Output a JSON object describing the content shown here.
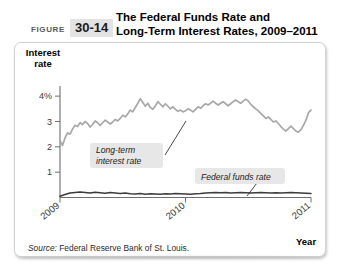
{
  "figure": {
    "label": "FIGURE",
    "number": "30-14",
    "title_line1": "The Federal Funds Rate and",
    "title_line2": "Long-Term Interest Rates, 2009–2011"
  },
  "axes": {
    "y_title_line1": "Interest",
    "y_title_line2": "rate",
    "x_title": "Year"
  },
  "annotations": {
    "long_term_line1": "Long-term",
    "long_term_line2": "interest rate",
    "fed_funds": "Federal funds rate"
  },
  "source": {
    "prefix": "Source:",
    "text": " Federal Reserve Bank of St. Louis."
  },
  "colors": {
    "long_term_line": "#a8a8a8",
    "fed_funds_line": "#3c3c3c",
    "axis": "#6e6e6e",
    "badge_bg": "#e3e3e3",
    "annotation_bg": "#e7e7e7",
    "card_border": "#d2d2d2"
  },
  "chart_data": {
    "type": "line",
    "title": "The Federal Funds Rate and Long-Term Interest Rates, 2009–2011",
    "xlabel": "Year",
    "ylabel": "Interest rate",
    "ylim": [
      0,
      4.4
    ],
    "xlim": [
      2009.0,
      2011.0
    ],
    "ytick_labels": [
      "4%",
      "3",
      "2",
      "1"
    ],
    "ytick_values": [
      4,
      3,
      2,
      1
    ],
    "xtick_labels": [
      "2009",
      "2010",
      "2011"
    ],
    "xtick_values": [
      2009,
      2010,
      2011
    ],
    "grid": false,
    "legend": "annotations-inline",
    "series": [
      {
        "name": "Long-term interest rate",
        "color": "#a8a8a8",
        "x": [
          2009.0,
          2009.02,
          2009.04,
          2009.06,
          2009.08,
          2009.1,
          2009.12,
          2009.14,
          2009.16,
          2009.18,
          2009.2,
          2009.22,
          2009.24,
          2009.26,
          2009.28,
          2009.3,
          2009.32,
          2009.34,
          2009.36,
          2009.38,
          2009.4,
          2009.42,
          2009.44,
          2009.46,
          2009.48,
          2009.5,
          2009.52,
          2009.54,
          2009.56,
          2009.58,
          2009.6,
          2009.62,
          2009.64,
          2009.66,
          2009.68,
          2009.7,
          2009.72,
          2009.74,
          2009.76,
          2009.78,
          2009.8,
          2009.82,
          2009.84,
          2009.86,
          2009.88,
          2009.9,
          2009.92,
          2009.94,
          2009.96,
          2009.98,
          2010.0,
          2010.02,
          2010.04,
          2010.06,
          2010.08,
          2010.1,
          2010.12,
          2010.14,
          2010.16,
          2010.18,
          2010.2,
          2010.22,
          2010.24,
          2010.26,
          2010.28,
          2010.3,
          2010.32,
          2010.34,
          2010.36,
          2010.38,
          2010.4,
          2010.42,
          2010.44,
          2010.46,
          2010.48,
          2010.5,
          2010.52,
          2010.54,
          2010.56,
          2010.58,
          2010.6,
          2010.62,
          2010.64,
          2010.66,
          2010.68,
          2010.7,
          2010.72,
          2010.74,
          2010.76,
          2010.78,
          2010.8,
          2010.82,
          2010.84,
          2010.86,
          2010.88,
          2010.9,
          2010.92,
          2010.94,
          2010.96,
          2010.98,
          2011.0
        ],
        "values": [
          2.25,
          2.05,
          2.35,
          2.55,
          2.5,
          2.7,
          2.85,
          2.8,
          2.95,
          2.88,
          3.0,
          2.92,
          2.78,
          2.88,
          3.02,
          2.95,
          2.85,
          2.95,
          3.05,
          2.98,
          2.9,
          2.98,
          3.08,
          3.02,
          3.12,
          3.25,
          3.18,
          3.3,
          3.45,
          3.38,
          3.55,
          3.72,
          3.9,
          3.75,
          3.6,
          3.72,
          3.55,
          3.48,
          3.62,
          3.78,
          3.68,
          3.58,
          3.7,
          3.6,
          3.5,
          3.58,
          3.48,
          3.4,
          3.45,
          3.38,
          3.42,
          3.5,
          3.45,
          3.38,
          3.48,
          3.58,
          3.52,
          3.62,
          3.7,
          3.65,
          3.72,
          3.8,
          3.72,
          3.65,
          3.72,
          3.78,
          3.7,
          3.62,
          3.7,
          3.78,
          3.85,
          3.78,
          3.72,
          3.8,
          3.88,
          3.8,
          3.68,
          3.58,
          3.5,
          3.42,
          3.32,
          3.22,
          3.12,
          3.18,
          3.08,
          2.98,
          3.02,
          2.92,
          2.8,
          2.7,
          2.62,
          2.72,
          2.82,
          2.72,
          2.62,
          2.58,
          2.68,
          2.85,
          3.05,
          3.35,
          3.45
        ]
      },
      {
        "name": "Federal funds rate",
        "color": "#3c3c3c",
        "x": [
          2009.0,
          2009.04,
          2009.08,
          2009.12,
          2009.16,
          2009.2,
          2009.24,
          2009.28,
          2009.32,
          2009.36,
          2009.4,
          2009.44,
          2009.48,
          2009.52,
          2009.56,
          2009.6,
          2009.64,
          2009.68,
          2009.72,
          2009.76,
          2009.8,
          2009.84,
          2009.88,
          2009.92,
          2009.96,
          2010.0,
          2010.04,
          2010.08,
          2010.12,
          2010.16,
          2010.2,
          2010.24,
          2010.28,
          2010.32,
          2010.36,
          2010.4,
          2010.44,
          2010.48,
          2010.52,
          2010.56,
          2010.6,
          2010.64,
          2010.68,
          2010.72,
          2010.76,
          2010.8,
          2010.84,
          2010.88,
          2010.92,
          2010.96,
          2011.0
        ],
        "values": [
          0.05,
          0.12,
          0.18,
          0.2,
          0.22,
          0.2,
          0.18,
          0.21,
          0.19,
          0.17,
          0.2,
          0.18,
          0.16,
          0.18,
          0.15,
          0.14,
          0.16,
          0.13,
          0.15,
          0.14,
          0.13,
          0.15,
          0.14,
          0.16,
          0.15,
          0.14,
          0.13,
          0.15,
          0.16,
          0.18,
          0.19,
          0.2,
          0.19,
          0.2,
          0.18,
          0.19,
          0.2,
          0.19,
          0.18,
          0.19,
          0.2,
          0.19,
          0.18,
          0.19,
          0.18,
          0.19,
          0.2,
          0.19,
          0.18,
          0.17,
          0.16
        ]
      }
    ]
  }
}
